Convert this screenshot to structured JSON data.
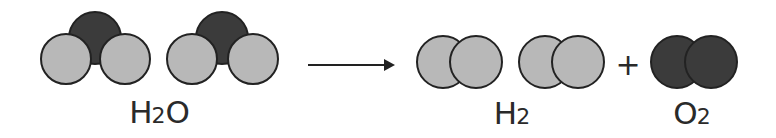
{
  "diagram": {
    "colors": {
      "hydrogen": "#b8b8b8",
      "oxygen": "#3b3b3b",
      "outline": "#222222",
      "text": "#2a2a2a"
    },
    "reactants": {
      "label_main": "H",
      "label_sub": "2",
      "label_tail": "O",
      "molecules": [
        {
          "type": "H2O",
          "atoms": [
            {
              "element": "H",
              "cx": 66,
              "cy": 59,
              "r": 25
            },
            {
              "element": "H",
              "cx": 125,
              "cy": 59,
              "r": 25
            },
            {
              "element": "O",
              "cx": 95,
              "cy": 38,
              "r": 26
            }
          ]
        },
        {
          "type": "H2O",
          "atoms": [
            {
              "element": "H",
              "cx": 192,
              "cy": 59,
              "r": 25
            },
            {
              "element": "H",
              "cx": 253,
              "cy": 59,
              "r": 25
            },
            {
              "element": "O",
              "cx": 222,
              "cy": 38,
              "r": 26
            }
          ]
        }
      ]
    },
    "arrow": {
      "x1": 308,
      "x2": 395,
      "y": 65
    },
    "products": [
      {
        "label_main": "H",
        "label_sub": "2",
        "molecules": [
          {
            "type": "H2",
            "atoms": [
              {
                "element": "H",
                "cx": 443,
                "cy": 62,
                "r": 26
              },
              {
                "element": "H",
                "cx": 476,
                "cy": 62,
                "r": 26
              }
            ]
          },
          {
            "type": "H2",
            "atoms": [
              {
                "element": "H",
                "cx": 545,
                "cy": 62,
                "r": 26
              },
              {
                "element": "H",
                "cx": 578,
                "cy": 62,
                "r": 26
              }
            ]
          }
        ]
      },
      {
        "label_main": "O",
        "label_sub": "2",
        "molecules": [
          {
            "type": "O2",
            "atoms": [
              {
                "element": "O",
                "cx": 677,
                "cy": 62,
                "r": 26
              },
              {
                "element": "O",
                "cx": 711,
                "cy": 62,
                "r": 26
              }
            ]
          }
        ]
      }
    ],
    "plus_sign": "+"
  }
}
